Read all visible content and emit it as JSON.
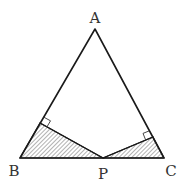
{
  "diagram": {
    "labels": {
      "A": "A",
      "B": "B",
      "C": "C",
      "P": "P"
    },
    "points": {
      "A": [
        95,
        29
      ],
      "B": [
        20,
        158
      ],
      "C": [
        164,
        158
      ],
      "P": [
        103,
        158
      ],
      "foot_AB": [
        40,
        123
      ],
      "foot_AC": [
        153,
        137
      ]
    },
    "shaded_regions": [
      "triangle B-P-foot_AB",
      "triangle C-P-foot_AC"
    ],
    "right_angle_marks": [
      "foot_AB",
      "foot_AC"
    ],
    "colors": {
      "line": "#1a1a1a",
      "hatch": "#555555",
      "label": "#333333",
      "background": "#ffffff"
    }
  }
}
